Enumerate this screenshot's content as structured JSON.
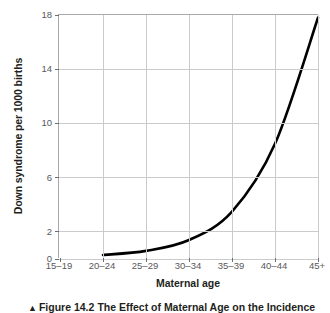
{
  "chart_data": {
    "type": "line",
    "title": "",
    "xlabel": "Maternal age",
    "ylabel": "Down syndrome per 1000 births",
    "categories": [
      "15–19",
      "20–24",
      "25–29",
      "30–34",
      "35–39",
      "40–44",
      "45+"
    ],
    "yticks": [
      0,
      2,
      6,
      10,
      14,
      18
    ],
    "ytick_labels": [
      "0",
      "2",
      "6",
      "10",
      "14",
      "18"
    ],
    "ylim": [
      0,
      18
    ],
    "grid": "both",
    "legend": "none",
    "series": [
      {
        "name": "Incidence of Down syndrome",
        "color": "#000000",
        "x": [
          "15–19",
          "20–24",
          "25–29",
          "30–34",
          "35–39",
          "40–44",
          "45+"
        ],
        "values": [
          null,
          0.3,
          0.6,
          1.4,
          3.5,
          8.5,
          17.8
        ],
        "points": [
          {
            "x": "20–24",
            "y": 0.3
          },
          {
            "x": "25–29",
            "y": 0.6
          },
          {
            "x": "30–34",
            "y": 1.4
          },
          {
            "x": "35–39",
            "y": 3.5
          },
          {
            "x": "40–44",
            "y": 8.5
          },
          {
            "x": "45+",
            "y": 17.8
          }
        ]
      }
    ]
  },
  "axis": {
    "y_title": "Down syndrome per 1000 births",
    "x_title": "Maternal age",
    "y_tick_labels": [
      "18",
      "14",
      "10",
      "6",
      "2",
      "0"
    ],
    "x_tick_labels": [
      "15–19",
      "20–24",
      "25–29",
      "30–34",
      "35–39",
      "40–44",
      "45+"
    ]
  },
  "caption": {
    "marker": "▲",
    "figure_number": "Figure 14.2",
    "text": "The Effect of Maternal Age on the Incidence"
  },
  "colors": {
    "curve": "#000000",
    "grid": "#c9cbcd",
    "axis": "#a7a9ac",
    "tick_text": "#58595b",
    "title_text": "#231f20",
    "background": "#ffffff"
  }
}
